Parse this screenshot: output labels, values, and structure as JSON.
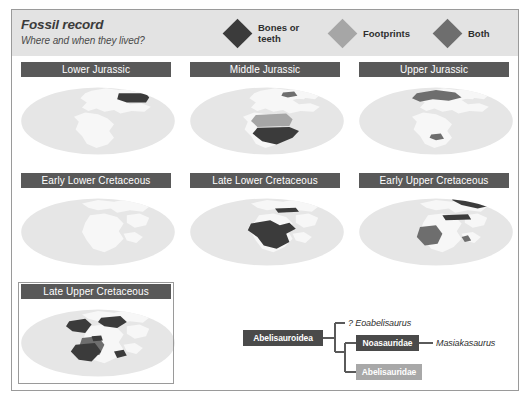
{
  "header": {
    "title": "Fossil record",
    "subtitle": "Where and when they lived?",
    "background": "#e3e3e3",
    "legend": [
      {
        "label": "Bones or\nteeth",
        "color": "#3b3b3b",
        "icon": "diamond-icon"
      },
      {
        "label": "Footprints",
        "color": "#a6a6a6",
        "icon": "diamond-icon"
      },
      {
        "label": "Both",
        "color": "#6e6e6e",
        "icon": "diamond-icon"
      }
    ]
  },
  "colors": {
    "era_bar": "#595959",
    "era_bar_text": "#ffffff",
    "ocean": "#e6e6e6",
    "land": "#f7f7f7",
    "bones": "#3b3b3b",
    "footprints": "#a6a6a6",
    "both": "#6e6e6e",
    "panel_border": "#9a9a9a"
  },
  "maps": [
    {
      "era": "Lower Jurassic",
      "row": 0,
      "col": 0,
      "regions": [
        {
          "name": "europe-east-laurasia",
          "type": "bones"
        }
      ]
    },
    {
      "era": "Middle Jurassic",
      "row": 0,
      "col": 1,
      "regions": [
        {
          "name": "north-gondwana",
          "type": "footprints"
        },
        {
          "name": "south-gondwana",
          "type": "bones"
        },
        {
          "name": "north-laurasia-spot",
          "type": "both"
        }
      ]
    },
    {
      "era": "Upper Jurassic",
      "row": 0,
      "col": 2,
      "regions": [
        {
          "name": "western-laurasia",
          "type": "both"
        },
        {
          "name": "southern-tip",
          "type": "both"
        }
      ]
    },
    {
      "era": "Early Lower Cretaceous",
      "row": 1,
      "col": 0,
      "regions": []
    },
    {
      "era": "Late Lower Cretaceous",
      "row": 1,
      "col": 1,
      "regions": [
        {
          "name": "central-gondwana",
          "type": "bones"
        },
        {
          "name": "north-strip",
          "type": "bones"
        }
      ]
    },
    {
      "era": "Early Upper Cretaceous",
      "row": 1,
      "col": 2,
      "regions": [
        {
          "name": "northeast-laurasia",
          "type": "bones"
        },
        {
          "name": "south-america",
          "type": "both"
        },
        {
          "name": "north-africa-strip",
          "type": "bones"
        },
        {
          "name": "madagascar-spot",
          "type": "both"
        }
      ]
    },
    {
      "era": "Late Upper Cretaceous",
      "row": 2,
      "col": 0,
      "regions": [
        {
          "name": "west-europe",
          "type": "bones"
        },
        {
          "name": "east-asia",
          "type": "bones"
        },
        {
          "name": "south-america",
          "type": "both"
        },
        {
          "name": "central-spot",
          "type": "bones"
        },
        {
          "name": "india",
          "type": "bones"
        },
        {
          "name": "madagascar",
          "type": "bones"
        }
      ]
    }
  ],
  "cladogram": {
    "nodes": [
      {
        "id": "abelisauroidea",
        "label": "Abelisauroidea",
        "style": "dark-box"
      },
      {
        "id": "eoabelisaurus",
        "label": "? Eoabelisaurus",
        "style": "plain-italic"
      },
      {
        "id": "noasauridae",
        "label": "Noasauridae",
        "style": "dark-box"
      },
      {
        "id": "masiakasaurus",
        "label": "Masiakasaurus",
        "style": "plain-italic"
      },
      {
        "id": "abelisauridae",
        "label": "Abelisauridae",
        "style": "light-box"
      }
    ]
  }
}
